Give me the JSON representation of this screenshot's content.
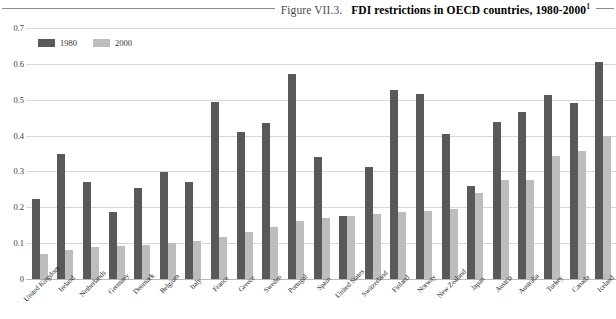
{
  "figure": {
    "number_label": "Figure VII.3.",
    "title": "FDI restrictions in OECD countries, 1980-2000",
    "footnote_marker": "1"
  },
  "colors": {
    "series_1980": "#595959",
    "series_2000": "#bdbdbd",
    "gridline": "#d6d6d6",
    "rule": "#8a8a8a"
  },
  "legend": {
    "position": "top-left",
    "items": [
      {
        "label": "1980",
        "color": "#595959"
      },
      {
        "label": "2000",
        "color": "#bdbdbd"
      }
    ]
  },
  "chart_data": {
    "type": "bar",
    "title": "FDI restrictions in OECD countries, 1980-2000",
    "xlabel": "",
    "ylabel": "",
    "ylim": [
      0,
      0.7
    ],
    "ytick_labels": [
      "0.7",
      "0.6",
      "0.5",
      "0.4",
      "0.3",
      "0.2",
      "0.1",
      "0"
    ],
    "ytick_values": [
      0.7,
      0.6,
      0.5,
      0.4,
      0.3,
      0.2,
      0.1,
      0
    ],
    "grid": true,
    "legend_position": "top-left",
    "categories": [
      "United Kingdom",
      "Ireland",
      "Netherlands",
      "Germany",
      "Denmark",
      "Belgium",
      "Italy",
      "France",
      "Greece",
      "Sweden",
      "Portugal",
      "Spain",
      "United States",
      "Switzerland",
      "Finland",
      "Norway",
      "New Zealand",
      "Japan",
      "Austria",
      "Australia",
      "Turkey",
      "Canada",
      "Iceland"
    ],
    "series": [
      {
        "name": "1980",
        "values": [
          0.222,
          0.348,
          0.27,
          0.186,
          0.254,
          0.298,
          0.27,
          0.493,
          0.41,
          0.434,
          0.573,
          0.341,
          0.176,
          0.313,
          0.527,
          0.515,
          0.404,
          0.259,
          0.437,
          0.466,
          0.512,
          0.49,
          0.605
        ]
      },
      {
        "name": "2000",
        "values": [
          0.07,
          0.081,
          0.089,
          0.092,
          0.094,
          0.1,
          0.105,
          0.117,
          0.131,
          0.145,
          0.163,
          0.17,
          0.175,
          0.18,
          0.186,
          0.19,
          0.196,
          0.24,
          0.276,
          0.277,
          0.342,
          0.356,
          0.398
        ]
      }
    ]
  }
}
